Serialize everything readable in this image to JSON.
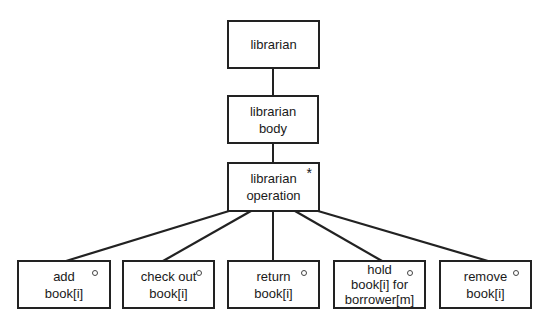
{
  "diagram": {
    "type": "jackson-structure-tree",
    "nodes": [
      {
        "id": "librarian",
        "lines": [
          "librarian"
        ],
        "marker": ""
      },
      {
        "id": "librarian-body",
        "lines": [
          "librarian",
          "body"
        ],
        "marker": ""
      },
      {
        "id": "librarian-operation",
        "lines": [
          "librarian",
          "operation"
        ],
        "marker": "*"
      },
      {
        "id": "add-book",
        "lines": [
          "add",
          "book[i]"
        ],
        "marker": "o"
      },
      {
        "id": "check-out-book",
        "lines": [
          "check out",
          "book[i]"
        ],
        "marker": "o"
      },
      {
        "id": "return-book",
        "lines": [
          "return",
          "book[i]"
        ],
        "marker": "o"
      },
      {
        "id": "hold-book",
        "lines": [
          "hold",
          "book[i] for",
          "borrower[m]"
        ],
        "marker": "o"
      },
      {
        "id": "remove-book",
        "lines": [
          "remove",
          "book[i]"
        ],
        "marker": "o"
      }
    ],
    "edges": [
      {
        "from": "librarian",
        "to": "librarian-body"
      },
      {
        "from": "librarian-body",
        "to": "librarian-operation"
      },
      {
        "from": "librarian-operation",
        "to": "add-book"
      },
      {
        "from": "librarian-operation",
        "to": "check-out-book"
      },
      {
        "from": "librarian-operation",
        "to": "return-book"
      },
      {
        "from": "librarian-operation",
        "to": "hold-book"
      },
      {
        "from": "librarian-operation",
        "to": "remove-book"
      }
    ],
    "colors": {
      "line": "#222222",
      "background": "#ffffff"
    }
  }
}
